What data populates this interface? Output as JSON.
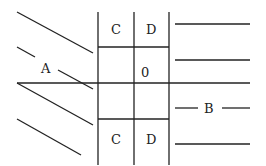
{
  "diagram": {
    "labels": {
      "a": "A",
      "b": "B",
      "cell_top_left": "C",
      "cell_top_right": "D",
      "cell_center": "0",
      "cell_bottom_left": "C",
      "cell_bottom_right": "D"
    },
    "colors": {
      "line": "#222222",
      "background": "#ffffff"
    }
  }
}
